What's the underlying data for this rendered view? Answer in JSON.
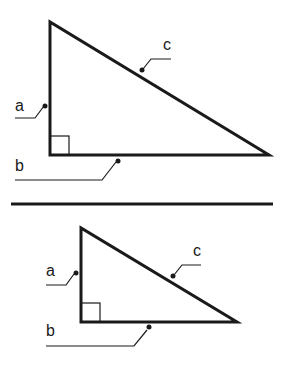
{
  "diagram": {
    "colors": {
      "stroke": "#1a1a1a",
      "background": "#ffffff"
    },
    "triangles": [
      {
        "id": "large",
        "labels": {
          "a": "a",
          "b": "b",
          "c": "c"
        }
      },
      {
        "id": "small",
        "labels": {
          "a": "a",
          "b": "b",
          "c": "c"
        }
      }
    ]
  }
}
